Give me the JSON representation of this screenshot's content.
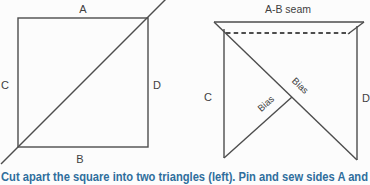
{
  "figure_left": {
    "side_top": "A",
    "side_bottom": "B",
    "side_left": "C",
    "side_right": "D"
  },
  "figure_right": {
    "seam_label": "A-B seam",
    "bias_label_upper": "Bias",
    "bias_label_lower": "Bias",
    "side_left": "C",
    "side_right": "D"
  },
  "caption": "Cut apart the square into two triangles (left). Pin and sew sides A and",
  "colors": {
    "line": "#4d4d4d",
    "label": "#3f3f3f",
    "caption": "#2f6e9c",
    "background": "#fcfcfc"
  }
}
